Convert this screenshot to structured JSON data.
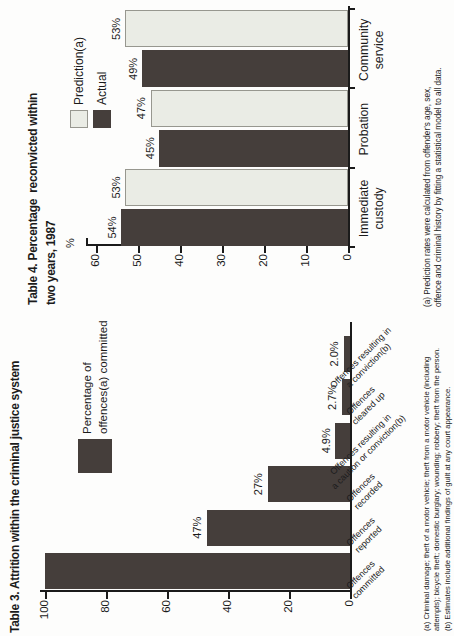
{
  "page": {
    "background": "#fdfdfc",
    "ink": "#1b1b1b",
    "orientation_note": "landscape page rotated 90 degrees counter-clockwise"
  },
  "chart_data": [
    {
      "id": "table3",
      "type": "bar",
      "title": "Table 3. Attrition within the criminal justice system",
      "legend_lines": [
        "Percentage of",
        "offences(a) committed"
      ],
      "bar_color": "#453E3B",
      "categories": [
        "Offences committed",
        "Offences reported",
        "Offences recorded",
        "Offences resulting in a caution or conviction(b)",
        "Offences cleared up",
        "Offences resulting in a conviction(b)"
      ],
      "category_lines": [
        [
          "Offences",
          "committed"
        ],
        [
          "Offences",
          "reported"
        ],
        [
          "Offences",
          "recorded"
        ],
        [
          "Offences resulting in",
          "a caution or conviction(b)"
        ],
        [
          "Offences",
          "cleared up"
        ],
        [
          "Offences resulting in",
          "a conviction(b)"
        ]
      ],
      "values": [
        100,
        47,
        27,
        4.9,
        2.7,
        2.0
      ],
      "bar_labels": [
        "",
        "47%",
        "27%",
        "4.9%",
        "2.7%",
        "2.0%"
      ],
      "xlabel": "",
      "ylabel": "",
      "ylim": [
        0,
        100
      ],
      "yticks": [
        0,
        20,
        40,
        60,
        80,
        100
      ],
      "grid": false,
      "footnotes": [
        "(a) Criminal damage; theft of a motor vehicle; theft from a motor vehicle (including",
        "attempts); bicycle theft; domestic burglary; wounding; robbery; theft from the person.",
        "(b) Estimates include additional findings of guilt at any court appearance."
      ]
    },
    {
      "id": "table4",
      "type": "bar",
      "title": "Table 4. Percentage  reconvicted within two years, 1987",
      "title_lines": [
        "Table 4. Percentage  reconvicted within",
        "two years, 1987"
      ],
      "categories": [
        "Immediate custody",
        "Probation",
        "Community service"
      ],
      "category_lines": [
        [
          "Immediate",
          "custody"
        ],
        [
          "Probation"
        ],
        [
          "Community",
          "service"
        ]
      ],
      "series": [
        {
          "name": "Actual",
          "color": "#453E3B",
          "border": "",
          "values": [
            54,
            45,
            49
          ],
          "labels": [
            "54%",
            "45%",
            "49%"
          ]
        },
        {
          "name": "Prediction(a)",
          "color": "#EAECE5",
          "border": "#97978F",
          "values": [
            53,
            47,
            53
          ],
          "labels": [
            "53%",
            "47%",
            "53%"
          ]
        }
      ],
      "legend_position": "top-right",
      "xlabel": "",
      "ylabel": "%",
      "ylim": [
        0,
        60
      ],
      "yticks": [
        0,
        10,
        20,
        30,
        40,
        50,
        60
      ],
      "grid": false,
      "footnotes": [
        "(a) Prediction rates were calculated from offender's age, sex,",
        "offence and criminal history by fitting a statistical model to all data."
      ]
    }
  ]
}
